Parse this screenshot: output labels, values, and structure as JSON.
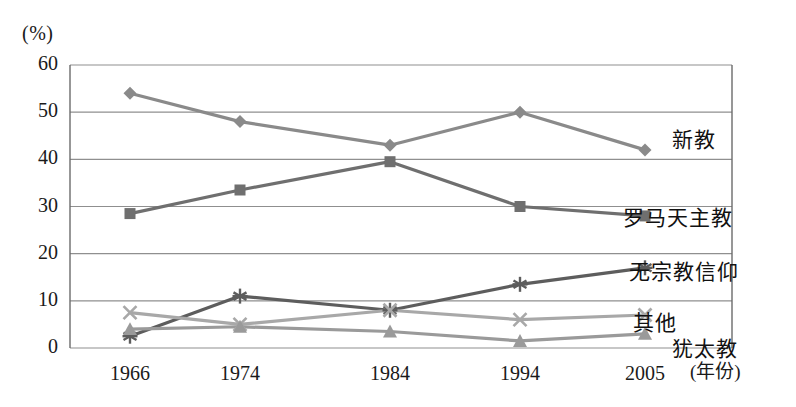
{
  "chart_data": {
    "type": "line",
    "title": "",
    "subtitle": "",
    "xlabel": "(年份)",
    "ylabel": "(%)",
    "unit_label": "(%)",
    "categories": [
      "1966",
      "1974",
      "1984",
      "1994",
      "2005"
    ],
    "x": [
      1966,
      1974,
      1984,
      1994,
      2005
    ],
    "ylim": [
      0,
      60
    ],
    "yticks": [
      "0",
      "10",
      "20",
      "30",
      "40",
      "50",
      "60"
    ],
    "ytick_values": [
      0,
      10,
      20,
      30,
      40,
      50,
      60
    ],
    "grid": true,
    "legend_position": "right-inline",
    "series": [
      {
        "name": "新教",
        "label": "新教",
        "marker": "diamond",
        "color": "#8a8a8a",
        "values": [
          54,
          48,
          43,
          50,
          42
        ],
        "label_x": 672,
        "label_y": 138
      },
      {
        "name": "罗马天主教",
        "label": "罗马天主教",
        "marker": "square",
        "color": "#6f6f6f",
        "values": [
          28.5,
          33.5,
          39.5,
          30,
          28
        ],
        "label_x": 623,
        "label_y": 216
      },
      {
        "name": "无宗教信仰",
        "label": "无宗教信仰",
        "marker": "asterisk",
        "color": "#5d5d5d",
        "values": [
          2.5,
          11,
          8,
          13.5,
          17
        ],
        "label_x": 629,
        "label_y": 270
      },
      {
        "name": "其他",
        "label": "其他",
        "marker": "cross",
        "color": "#a8a8a8",
        "values": [
          7.5,
          5,
          8,
          6,
          7
        ],
        "label_x": 633,
        "label_y": 321
      },
      {
        "name": "犹太教",
        "label": "犹太教",
        "marker": "triangle",
        "color": "#9a9a9a",
        "values": [
          4,
          4.5,
          3.5,
          1.5,
          3
        ],
        "label_x": 672,
        "label_y": 347
      }
    ]
  },
  "axes": {
    "frame_color": "#6b6b6b",
    "grid_color": "#8f8f8f",
    "x_positions": [
      130,
      240,
      390,
      520,
      645
    ],
    "plot_left": 70,
    "plot_right": 732,
    "plot_top": 65,
    "plot_bottom": 348
  },
  "xaxis_title_pos": {
    "x": 690,
    "y": 372
  }
}
